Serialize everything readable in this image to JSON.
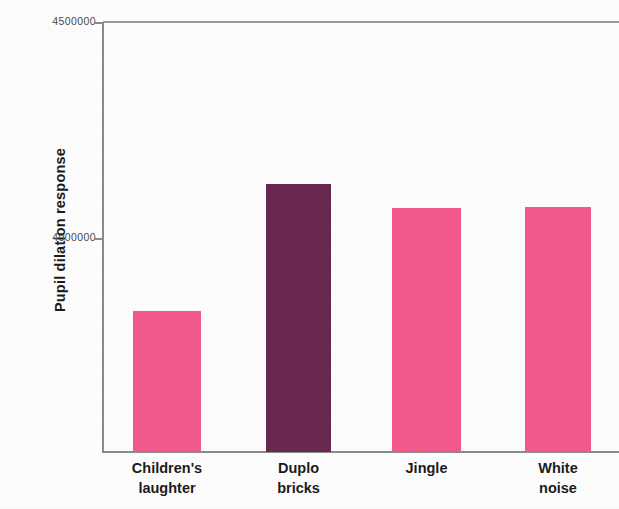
{
  "chart_data": {
    "type": "bar",
    "title": "",
    "xlabel": "",
    "ylabel": "Pupil dilation response",
    "categories": [
      "Children's laughter",
      "Duplo bricks",
      "Jingle",
      "White noise"
    ],
    "category_lines": [
      [
        "Children's",
        "laughter"
      ],
      [
        "Duplo",
        "bricks"
      ],
      [
        "Jingle"
      ],
      [
        "White",
        "noise"
      ]
    ],
    "values": [
      3831000,
      4125000,
      4069000,
      4071000
    ],
    "ylim": [
      3550000,
      4500000
    ],
    "ytick_values": [
      4500000,
      4000000
    ],
    "ytick_labels": [
      "4500000",
      "4000000"
    ],
    "grid": false,
    "legend": false,
    "bar_colors": [
      "#f2598b",
      "#68284f",
      "#f2598b",
      "#f2598b"
    ],
    "highlight_color": "#68284f",
    "default_color": "#f2598b",
    "axis_color": "#8a8a8a",
    "note": "fourth bar and plot frame cropped at right edge of image"
  },
  "axis": {
    "y_title": "Pupil dilation response"
  }
}
